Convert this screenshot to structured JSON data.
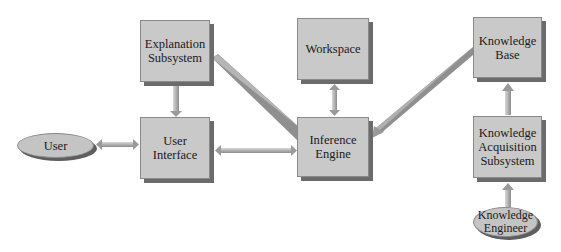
{
  "diagram": {
    "title": "",
    "nodes": [
      {
        "id": "explanation",
        "label": "Explanation\nSubsystem",
        "shape": "box",
        "x": 140,
        "y": 20,
        "w": 70,
        "h": 62
      },
      {
        "id": "workspace",
        "label": "Workspace",
        "shape": "box",
        "x": 297,
        "y": 18,
        "w": 72,
        "h": 62
      },
      {
        "id": "knowledge_base",
        "label": "Knowledge\nBase",
        "shape": "box",
        "x": 473,
        "y": 17,
        "w": 69,
        "h": 61
      },
      {
        "id": "user",
        "label": "User",
        "shape": "ellipse",
        "x": 17,
        "y": 133,
        "w": 77,
        "h": 25
      },
      {
        "id": "user_interface",
        "label": "User\nInterface",
        "shape": "box",
        "x": 140,
        "y": 117,
        "w": 70,
        "h": 62
      },
      {
        "id": "inference_engine",
        "label": "Inference\nEngine",
        "shape": "box",
        "x": 297,
        "y": 117,
        "w": 72,
        "h": 60
      },
      {
        "id": "knowledge_acquisition",
        "label": "Knowledge\nAcquisition\nSubsystem",
        "shape": "box",
        "x": 473,
        "y": 116,
        "w": 69,
        "h": 62
      },
      {
        "id": "knowledge_engineer",
        "label": "Knowledge\nEngineer",
        "shape": "ellipse",
        "x": 473,
        "y": 207,
        "w": 65,
        "h": 30
      }
    ],
    "edges": [
      {
        "from": "explanation",
        "to": "user_interface",
        "direction": "to"
      },
      {
        "from": "user",
        "to": "user_interface",
        "direction": "both"
      },
      {
        "from": "user_interface",
        "to": "inference_engine",
        "direction": "both"
      },
      {
        "from": "explanation",
        "to": "inference_engine",
        "direction": "none"
      },
      {
        "from": "workspace",
        "to": "inference_engine",
        "direction": "both"
      },
      {
        "from": "knowledge_base",
        "to": "inference_engine",
        "direction": "to"
      },
      {
        "from": "knowledge_acquisition",
        "to": "knowledge_base",
        "direction": "to"
      },
      {
        "from": "knowledge_engineer",
        "to": "knowledge_acquisition",
        "direction": "to"
      }
    ],
    "colors": {
      "node_fill": "#c9c9c9",
      "node_shadow": "#6b6b6b",
      "connector": "#9a9a9a",
      "text": "#1a1a1a"
    }
  }
}
